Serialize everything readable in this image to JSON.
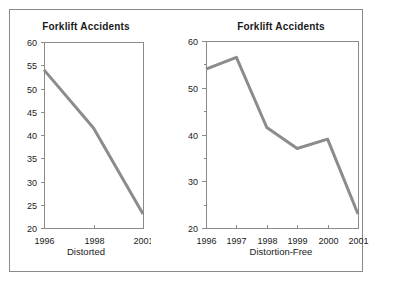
{
  "figure": {
    "background": "#ffffff",
    "frame_border_color": "#8a8a8a",
    "axis_color": "#8a8a8a",
    "text_color": "#1a1a1a"
  },
  "chart_data": [
    {
      "type": "line",
      "title": "Forklift Accidents",
      "footer_label": "Distorted",
      "x_tick_labels": [
        "1996",
        "1998",
        "2001"
      ],
      "values": [
        54,
        41.5,
        23
      ],
      "ylim": [
        20,
        60
      ],
      "y_tick_step": 5,
      "y_label_step": 5,
      "x_spacing": "equal-despite-unequal-intervals",
      "grid": false,
      "legend": false,
      "line_color": "#8c8c8c"
    },
    {
      "type": "line",
      "title": "Forklift Accidents",
      "footer_label": "Distortion-Free",
      "x_tick_labels": [
        "1996",
        "1997",
        "1998",
        "1999",
        "2000",
        "2001"
      ],
      "values": [
        54,
        56.5,
        41.5,
        37,
        39,
        23
      ],
      "ylim": [
        20,
        60
      ],
      "y_tick_step": 5,
      "y_label_step": 10,
      "x_spacing": "equal",
      "grid": false,
      "legend": false,
      "line_color": "#8c8c8c"
    }
  ]
}
